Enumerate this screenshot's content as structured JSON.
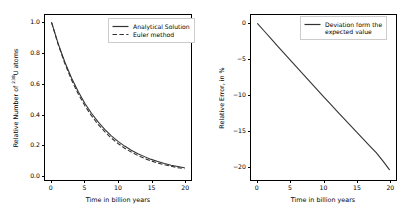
{
  "figure": {
    "background_color": "#ffffff",
    "line_color": "#333333",
    "axis_color": "#000000"
  },
  "chart_data": [
    {
      "type": "line",
      "panel": "left",
      "title": "",
      "xlabel": "Time in billion years",
      "ylabel_text": "Relative Number of ",
      "ylabel_superscript": "238",
      "ylabel_suffix": "U atoms",
      "xlim": [
        -1.0,
        21.0
      ],
      "ylim": [
        -0.03,
        1.05
      ],
      "xticks": [
        0,
        5,
        10,
        15,
        20
      ],
      "xticklabels": [
        "0",
        "5",
        "10",
        "15",
        "20"
      ],
      "yticks": [
        0.0,
        0.2,
        0.4,
        0.6,
        0.8,
        1.0
      ],
      "yticklabels": [
        "0.0",
        "0.2",
        "0.4",
        "0.6",
        "0.8",
        "1.0"
      ],
      "grid": false,
      "legend_position": "upper right",
      "x": [
        0,
        1,
        2,
        3,
        4,
        5,
        6,
        7,
        8,
        9,
        10,
        11,
        12,
        13,
        14,
        15,
        16,
        17,
        18,
        19,
        20
      ],
      "series": [
        {
          "name": "Analytical Solution",
          "style": "solid",
          "color": "#333333",
          "values": [
            1.0,
            0.861,
            0.741,
            0.638,
            0.549,
            0.472,
            0.407,
            0.35,
            0.301,
            0.259,
            0.223,
            0.192,
            0.165,
            0.142,
            0.123,
            0.105,
            0.091,
            0.078,
            0.067,
            0.058,
            0.05
          ]
        },
        {
          "name": "Euler method",
          "style": "dashed",
          "color": "#333333",
          "values": [
            1.0,
            0.855,
            0.731,
            0.625,
            0.534,
            0.457,
            0.391,
            0.334,
            0.286,
            0.244,
            0.209,
            0.178,
            0.153,
            0.13,
            0.111,
            0.095,
            0.081,
            0.07,
            0.06,
            0.051,
            0.044
          ]
        }
      ]
    },
    {
      "type": "line",
      "panel": "right",
      "title": "",
      "xlabel": "Time in billion years",
      "ylabel": "Relative Error, in %",
      "xlim": [
        -1.0,
        21.0
      ],
      "ylim": [
        -22.0,
        1.2
      ],
      "xticks": [
        0,
        5,
        10,
        15,
        20
      ],
      "xticklabels": [
        "0",
        "5",
        "10",
        "15",
        "20"
      ],
      "yticks": [
        0,
        -5,
        -10,
        -15,
        -20
      ],
      "yticklabels": [
        "0",
        "-5",
        "-10",
        "-15",
        "-20"
      ],
      "grid": false,
      "legend_position": "upper right",
      "x": [
        0,
        1,
        2,
        3,
        4,
        5,
        6,
        7,
        8,
        9,
        10,
        11,
        12,
        13,
        14,
        15,
        16,
        17,
        18,
        19,
        20
      ],
      "series": [
        {
          "name": "Deviation form the\nexpected value",
          "style": "solid",
          "color": "#333333",
          "values": [
            0.0,
            -1.05,
            -2.09,
            -3.13,
            -4.16,
            -5.19,
            -6.21,
            -7.23,
            -8.25,
            -9.26,
            -10.27,
            -11.27,
            -12.27,
            -13.26,
            -14.25,
            -15.23,
            -16.21,
            -17.19,
            -18.16,
            -19.32,
            -20.55
          ]
        }
      ]
    }
  ]
}
